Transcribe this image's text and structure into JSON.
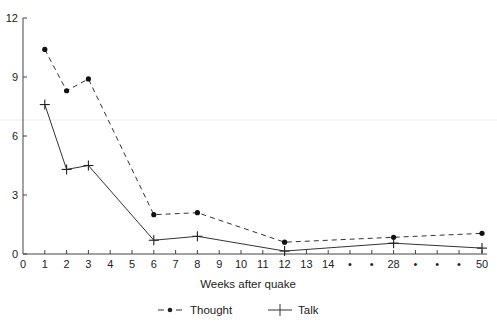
{
  "chart_data": {
    "type": "line",
    "title": "",
    "xlabel": "Weeks after quake",
    "ylabel": "",
    "ylim": [
      0,
      12
    ],
    "yticks": [
      0,
      3,
      6,
      9,
      12
    ],
    "grid": false,
    "legend_position": "bottom",
    "x_tick_labels": [
      "0",
      "1",
      "2",
      "3",
      "4",
      "5",
      "6",
      "7",
      "8",
      "9",
      "10",
      "11",
      "12",
      "13",
      "14",
      "•",
      "•",
      "28",
      "•",
      "•",
      "•",
      "50"
    ],
    "x": [
      1,
      2,
      3,
      6,
      8,
      12,
      28,
      50
    ],
    "series": [
      {
        "name": "Thought",
        "style": "dashed",
        "marker": "dot",
        "values": [
          10.4,
          8.3,
          8.9,
          2.0,
          2.1,
          0.6,
          0.85,
          1.05
        ]
      },
      {
        "name": "Talk",
        "style": "solid",
        "marker": "plus",
        "values": [
          7.6,
          4.3,
          4.5,
          0.7,
          0.9,
          0.15,
          0.55,
          0.3
        ]
      }
    ]
  },
  "legend": {
    "thought_label": "Thought",
    "talk_label": "Talk"
  },
  "colors": {
    "line": "#333333",
    "axis": "#444444",
    "text": "#222222"
  }
}
